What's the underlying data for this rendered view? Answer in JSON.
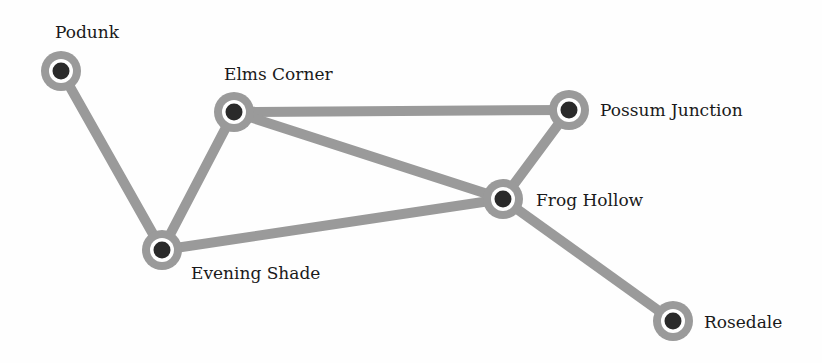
{
  "colors": {
    "edge": "#9a9a9a",
    "node_ring": "#9a9a9a",
    "node_gap": "#ffffff",
    "node_core": "#2a2a2a",
    "label": "#1a1a1a"
  },
  "nodes": [
    {
      "id": "podunk",
      "label": "Podunk",
      "x": 61,
      "y": 71,
      "label_x": 55,
      "label_y": 24
    },
    {
      "id": "elms-corner",
      "label": "Elms Corner",
      "x": 234,
      "y": 112,
      "label_x": 224,
      "label_y": 66
    },
    {
      "id": "possum-junction",
      "label": "Possum Junction",
      "x": 569,
      "y": 110,
      "label_x": 600,
      "label_y": 102
    },
    {
      "id": "frog-hollow",
      "label": "Frog Hollow",
      "x": 503,
      "y": 199,
      "label_x": 536,
      "label_y": 192
    },
    {
      "id": "evening-shade",
      "label": "Evening Shade",
      "x": 162,
      "y": 250,
      "label_x": 191,
      "label_y": 265
    },
    {
      "id": "rosedale",
      "label": "Rosedale",
      "x": 673,
      "y": 321,
      "label_x": 704,
      "label_y": 314
    }
  ],
  "edges": [
    {
      "from": "podunk",
      "to": "evening-shade"
    },
    {
      "from": "evening-shade",
      "to": "elms-corner"
    },
    {
      "from": "elms-corner",
      "to": "possum-junction"
    },
    {
      "from": "elms-corner",
      "to": "frog-hollow"
    },
    {
      "from": "possum-junction",
      "to": "frog-hollow"
    },
    {
      "from": "evening-shade",
      "to": "frog-hollow"
    },
    {
      "from": "frog-hollow",
      "to": "rosedale"
    }
  ]
}
